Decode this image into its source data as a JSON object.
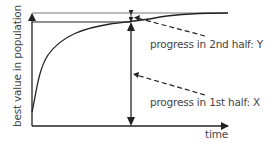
{
  "diagram": {
    "y_axis_label": "best value in population",
    "x_axis_label": "time",
    "annotations": [
      {
        "label": "progress in 2nd half: Y"
      },
      {
        "label": "progress in 1st half: X"
      }
    ],
    "colors": {
      "line": "#222222",
      "text": "#444444",
      "background": "#ffffff"
    }
  }
}
